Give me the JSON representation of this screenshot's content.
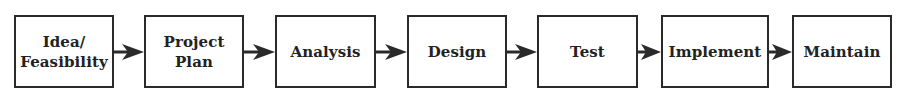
{
  "diagram": {
    "type": "process-flow",
    "steps": [
      {
        "label": "Idea/\nFeasibility"
      },
      {
        "label": "Project\nPlan"
      },
      {
        "label": "Analysis"
      },
      {
        "label": "Design"
      },
      {
        "label": "Test"
      },
      {
        "label": "Implement"
      },
      {
        "label": "Maintain"
      }
    ],
    "colors": {
      "stroke": "#2a2a2a",
      "text": "#222222",
      "background": "#ffffff"
    }
  }
}
